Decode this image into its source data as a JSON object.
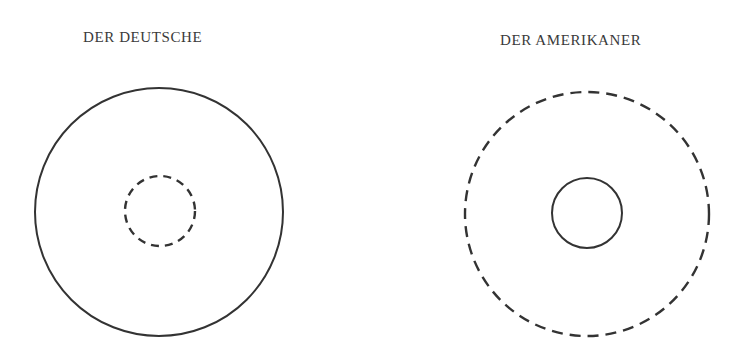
{
  "panels": [
    {
      "title": "DER DEUTSCHE",
      "outer_circle": {
        "cx": 159,
        "cy": 212,
        "r": 124,
        "style": "solid"
      },
      "inner_circle": {
        "cx": 160,
        "cy": 211,
        "r": 35,
        "style": "dashed"
      }
    },
    {
      "title": "DER AMERIKANER",
      "outer_circle": {
        "cx": 587,
        "cy": 214,
        "r": 122,
        "style": "dashed"
      },
      "inner_circle": {
        "cx": 587,
        "cy": 213,
        "r": 35,
        "style": "solid"
      }
    }
  ],
  "colors": {
    "stroke": "#333333",
    "text": "#3a3a3a",
    "background": "#ffffff"
  }
}
